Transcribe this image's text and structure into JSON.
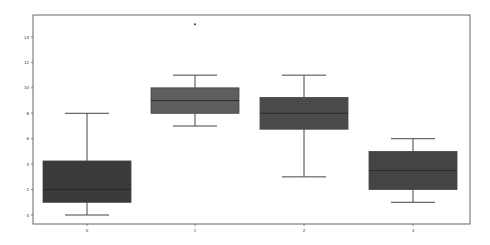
{
  "chart_data": {
    "type": "box",
    "title": "",
    "xlabel": "",
    "ylabel": "",
    "categories": [
      "0",
      "1",
      "2",
      "3"
    ],
    "ylim": [
      -0.6,
      15.7
    ],
    "yticks": [
      0,
      2,
      4,
      6,
      8,
      10,
      12,
      14
    ],
    "grid": false,
    "legend": null,
    "boxes": [
      {
        "category": "0",
        "whisker_low": 0,
        "q1": 1,
        "median": 2,
        "q3": 4.25,
        "whisker_high": 8,
        "outliers": [],
        "color": "#3a3a3a"
      },
      {
        "category": "1",
        "whisker_low": 7,
        "q1": 8,
        "median": 9,
        "q3": 10,
        "whisker_high": 11,
        "outliers": [
          15
        ],
        "color": "#5e5e5e"
      },
      {
        "category": "2",
        "whisker_low": 3,
        "q1": 6.75,
        "median": 8,
        "q3": 9.25,
        "whisker_high": 11,
        "outliers": [],
        "color": "#4a4a4a"
      },
      {
        "category": "3",
        "whisker_low": 1,
        "q1": 2,
        "median": 3.5,
        "q3": 5,
        "whisker_high": 6,
        "outliers": [],
        "color": "#444444"
      }
    ]
  },
  "style": {
    "frame_color": "#666666",
    "line_color": "#444444",
    "median_color": "#2a2a2a"
  }
}
